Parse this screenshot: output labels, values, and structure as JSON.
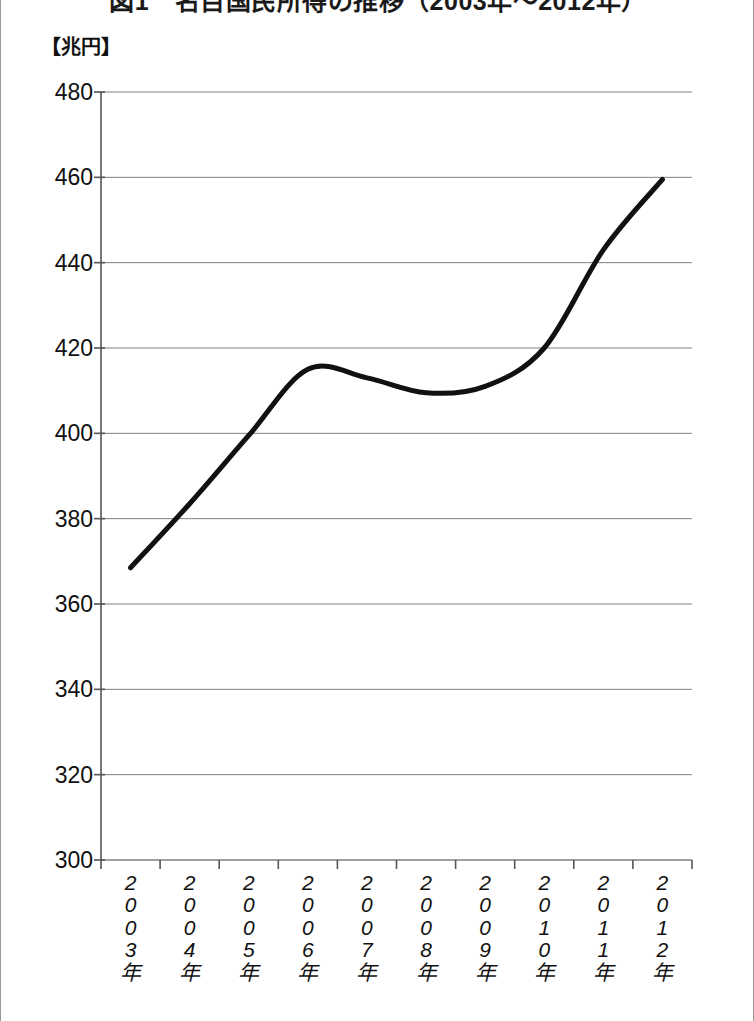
{
  "title": "図1　名目国民所得の推移（2003年～2012年）",
  "unit_label": "【兆円】",
  "chart_data": {
    "type": "line",
    "title": "図1　名目国民所得の推移（2003年～2012年）",
    "xlabel": "",
    "ylabel": "【兆円】",
    "unit": "兆円",
    "categories": [
      "2003年",
      "2004年",
      "2005年",
      "2006年",
      "2007年",
      "2008年",
      "2009年",
      "2010年",
      "2011年",
      "2012年"
    ],
    "values": [
      368.5,
      383.5,
      399.5,
      415.0,
      413.0,
      409.5,
      411.0,
      420.0,
      443.0,
      459.5
    ],
    "series": [
      {
        "name": "名目国民所得",
        "values": [
          368.5,
          383.5,
          399.5,
          415.0,
          413.0,
          409.5,
          411.0,
          420.0,
          443.0,
          459.5
        ]
      }
    ],
    "ylim": [
      300,
      480
    ],
    "yticks": [
      300,
      320,
      340,
      360,
      380,
      400,
      420,
      440,
      460,
      480
    ],
    "ytick_labels": [
      "300",
      "320",
      "340",
      "360",
      "380",
      "400",
      "420",
      "440",
      "460",
      "480"
    ],
    "grid": true,
    "grid_axis": "y",
    "legend": false,
    "line_color": "#111111",
    "line_width": 5,
    "grid_color": "#808080",
    "axis_color": "#555555",
    "smoothing": "spline",
    "markers": false
  },
  "y_axis": {
    "ticks": [
      {
        "label": "480",
        "value": 480
      },
      {
        "label": "460",
        "value": 460
      },
      {
        "label": "440",
        "value": 440
      },
      {
        "label": "420",
        "value": 420
      },
      {
        "label": "400",
        "value": 400
      },
      {
        "label": "380",
        "value": 380
      },
      {
        "label": "360",
        "value": 360
      },
      {
        "label": "340",
        "value": 340
      },
      {
        "label": "320",
        "value": 320
      },
      {
        "label": "300",
        "value": 300
      }
    ]
  },
  "x_axis": {
    "ticks": [
      {
        "label": "2003年",
        "chars": [
          "2",
          "0",
          "0",
          "3",
          "年"
        ]
      },
      {
        "label": "2004年",
        "chars": [
          "2",
          "0",
          "0",
          "4",
          "年"
        ]
      },
      {
        "label": "2005年",
        "chars": [
          "2",
          "0",
          "0",
          "5",
          "年"
        ]
      },
      {
        "label": "2006年",
        "chars": [
          "2",
          "0",
          "0",
          "6",
          "年"
        ]
      },
      {
        "label": "2007年",
        "chars": [
          "2",
          "0",
          "0",
          "7",
          "年"
        ]
      },
      {
        "label": "2008年",
        "chars": [
          "2",
          "0",
          "0",
          "8",
          "年"
        ]
      },
      {
        "label": "2009年",
        "chars": [
          "2",
          "0",
          "0",
          "9",
          "年"
        ]
      },
      {
        "label": "2010年",
        "chars": [
          "2",
          "0",
          "1",
          "0",
          "年"
        ]
      },
      {
        "label": "2011年",
        "chars": [
          "2",
          "0",
          "1",
          "1",
          "年"
        ]
      },
      {
        "label": "2012年",
        "chars": [
          "2",
          "0",
          "1",
          "2",
          "年"
        ]
      }
    ]
  },
  "colors": {
    "line": "#111111",
    "grid": "#808080",
    "axis": "#555555",
    "text": "#111111",
    "frame": "#9a9a9a",
    "background": "#ffffff"
  }
}
